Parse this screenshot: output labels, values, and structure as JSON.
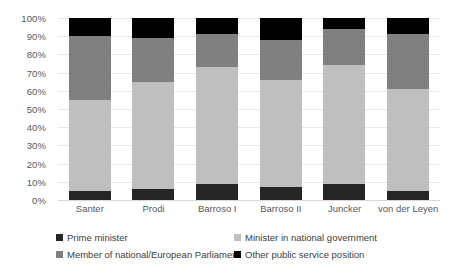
{
  "chart_data": {
    "type": "bar",
    "subtype": "stacked-100-percent",
    "title": "",
    "xlabel": "",
    "ylabel": "",
    "ylim": [
      0,
      100
    ],
    "grid": true,
    "legend_position": "bottom",
    "categories": [
      "Santer",
      "Prodi",
      "Barroso I",
      "Barroso II",
      "Juncker",
      "von der Leyen"
    ],
    "series": [
      {
        "name": "Prime minister",
        "color": "#262626",
        "values": [
          5,
          6,
          9,
          7,
          9,
          5
        ]
      },
      {
        "name": "Minister in national government",
        "color": "#bfbfbf",
        "values": [
          50,
          59,
          64,
          59,
          65,
          56
        ]
      },
      {
        "name": "Member of national/European Parliament",
        "color": "#808080",
        "values": [
          35,
          24,
          18,
          22,
          20,
          30
        ]
      },
      {
        "name": "Other public service position",
        "color": "#000000",
        "values": [
          10,
          11,
          9,
          12,
          6,
          9
        ]
      }
    ],
    "y_ticks": [
      "0%",
      "10%",
      "20%",
      "30%",
      "40%",
      "50%",
      "60%",
      "70%",
      "80%",
      "90%",
      "100%"
    ],
    "y_tick_values": [
      0,
      10,
      20,
      30,
      40,
      50,
      60,
      70,
      80,
      90,
      100
    ],
    "stack_order_bottom_to_top": [
      "Prime minister",
      "Minister in national government",
      "Member of national/European Parliament",
      "Other public service position"
    ],
    "cumulative_boundaries": {
      "Santer": [
        5,
        55,
        90,
        100
      ],
      "Prodi": [
        6,
        65,
        89,
        100
      ],
      "Barroso I": [
        9,
        73,
        91,
        100
      ],
      "Barroso II": [
        7,
        66,
        88,
        100
      ],
      "Juncker": [
        9,
        74,
        94,
        100
      ],
      "von der Leyen": [
        5,
        61,
        91,
        100
      ]
    }
  },
  "legend": {
    "rows": [
      [
        {
          "label": "Prime minister",
          "color": "#262626"
        },
        {
          "label": "Minister in national government",
          "color": "#bfbfbf"
        }
      ],
      [
        {
          "label": "Member of national/European Parliament",
          "color": "#808080"
        },
        {
          "label": "Other public service position",
          "color": "#000000"
        }
      ]
    ]
  },
  "colors": {
    "gridline": "#e8e8e8",
    "axis_text": "#595959",
    "legend_text": "#404040",
    "background": "#ffffff"
  }
}
